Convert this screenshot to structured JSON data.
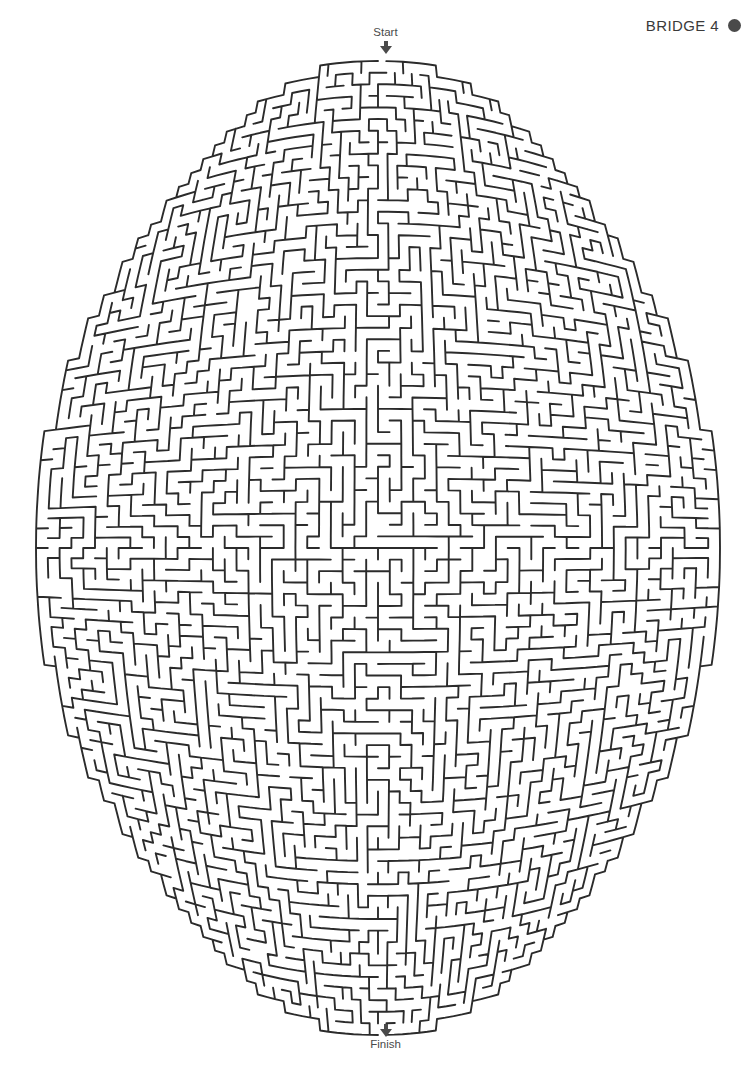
{
  "page": {
    "width": 755,
    "height": 1085,
    "background_color": "#ffffff",
    "type": "maze-puzzle"
  },
  "header": {
    "title": "BRIDGE 4",
    "dot_icon": "filled-circle-icon",
    "dot_color": "#4a4a4a",
    "text_color": "#3a3a3a"
  },
  "start": {
    "label": "Start",
    "arrow_icon": "arrow-down-icon",
    "x": 385,
    "y": 35
  },
  "finish": {
    "label": "Finish",
    "arrow_icon": "arrow-down-icon",
    "x": 385,
    "y": 1047
  },
  "maze": {
    "wall_color": "#2b2b2b",
    "wall_width": 1.9,
    "shape": "barrel-oval",
    "cols": 58,
    "rows": 84,
    "cell_size": 11.6,
    "center_x": 378,
    "center_y": 548,
    "half_width": 342,
    "half_height": 487,
    "bulge_x": 0.3,
    "bulge_y": 0.16,
    "entrance_col": 29,
    "exit_col": 29,
    "seed": 20240714
  }
}
